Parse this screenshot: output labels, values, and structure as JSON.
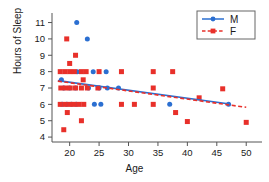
{
  "chart_data": {
    "type": "scatter",
    "title": "",
    "xlabel": "Age",
    "ylabel": "Hours of Sleep",
    "xlim": [
      17,
      52
    ],
    "ylim": [
      3.7,
      11.4
    ],
    "xticks": [
      20,
      25,
      30,
      35,
      40,
      45,
      50
    ],
    "yticks": [
      4,
      5,
      6,
      7,
      8,
      9,
      10,
      11
    ],
    "grid": false,
    "legend_position": "top-right",
    "legend": [
      {
        "name": "M",
        "color": "#2b6fd1",
        "marker": "circle",
        "linestyle": "solid"
      },
      {
        "name": "F",
        "color": "#e8302a",
        "marker": "square",
        "linestyle": "dashed"
      }
    ],
    "series": [
      {
        "name": "M",
        "color": "#2b6fd1",
        "marker": "circle",
        "points": [
          [
            21.2,
            11.0
          ],
          [
            23.0,
            10.0
          ],
          [
            21.3,
            8.0
          ],
          [
            24.0,
            8.0
          ],
          [
            26.2,
            8.0
          ],
          [
            18.6,
            7.5
          ],
          [
            19.0,
            7.0
          ],
          [
            20.0,
            7.0
          ],
          [
            21.0,
            7.0
          ],
          [
            23.2,
            7.0
          ],
          [
            25.0,
            7.0
          ],
          [
            26.4,
            7.0
          ],
          [
            28.3,
            7.0
          ],
          [
            18.7,
            6.0
          ],
          [
            19.5,
            6.0
          ],
          [
            20.3,
            6.0
          ],
          [
            21.1,
            6.0
          ],
          [
            24.2,
            6.0
          ],
          [
            25.3,
            6.0
          ],
          [
            37.0,
            6.0
          ],
          [
            47.0,
            6.0
          ]
        ],
        "trend": {
          "x": [
            18.0,
            47.2
          ],
          "y": [
            7.45,
            6.02
          ],
          "linestyle": "solid"
        }
      },
      {
        "name": "F",
        "color": "#e8302a",
        "marker": "square",
        "points": [
          [
            19.5,
            10.0
          ],
          [
            21.0,
            9.0
          ],
          [
            20.0,
            8.5
          ],
          [
            18.4,
            8.0
          ],
          [
            19.2,
            8.0
          ],
          [
            20.0,
            8.0
          ],
          [
            20.8,
            8.0
          ],
          [
            22.0,
            8.0
          ],
          [
            22.8,
            8.0
          ],
          [
            25.0,
            8.0
          ],
          [
            28.8,
            8.0
          ],
          [
            34.2,
            8.0
          ],
          [
            37.5,
            8.0
          ],
          [
            22.3,
            7.5
          ],
          [
            18.5,
            7.0
          ],
          [
            19.3,
            7.0
          ],
          [
            20.1,
            7.0
          ],
          [
            21.0,
            7.0
          ],
          [
            22.0,
            7.0
          ],
          [
            23.0,
            7.0
          ],
          [
            24.8,
            7.0
          ],
          [
            34.2,
            7.0
          ],
          [
            18.4,
            6.0
          ],
          [
            19.2,
            6.0
          ],
          [
            20.0,
            6.0
          ],
          [
            20.8,
            6.0
          ],
          [
            21.6,
            6.0
          ],
          [
            22.4,
            6.0
          ],
          [
            28.8,
            6.0
          ],
          [
            31.0,
            6.0
          ],
          [
            34.2,
            6.0
          ],
          [
            42.0,
            6.4
          ],
          [
            19.6,
            5.5
          ],
          [
            38.0,
            5.5
          ],
          [
            22.0,
            5.0
          ],
          [
            40.0,
            4.95
          ],
          [
            50.0,
            4.9
          ],
          [
            19.0,
            4.45
          ],
          [
            46.0,
            6.95
          ]
        ],
        "trend": {
          "x": [
            18.0,
            50.0
          ],
          "y": [
            7.42,
            5.82
          ],
          "linestyle": "dashed"
        }
      }
    ]
  },
  "axis": {
    "ylabel_text": "Hours of Sleep",
    "xlabel_text": "Age"
  }
}
